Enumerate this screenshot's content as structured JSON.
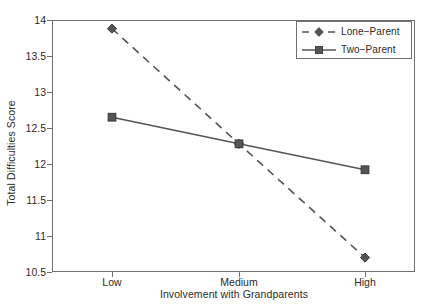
{
  "chart_data": {
    "type": "line",
    "title": "",
    "xlabel": "Involvement with Grandparents",
    "ylabel": "Total Difficulties Score",
    "categories": [
      "Low",
      "Medium",
      "High"
    ],
    "xtick_labels": [
      "Low",
      "Medium",
      "High"
    ],
    "ytick_labels": [
      "14",
      "13.5",
      "13",
      "12.5",
      "12",
      "11.5",
      "11",
      "10.5"
    ],
    "ytick_values": [
      14,
      13.5,
      13,
      12.5,
      12,
      11.5,
      11,
      10.5
    ],
    "ylim": [
      10.5,
      14
    ],
    "xlim": [
      0,
      2
    ],
    "grid": false,
    "legend_position": "top-right",
    "series": [
      {
        "name": "Lone−Parent",
        "values": [
          13.88,
          12.28,
          10.7
        ],
        "line_style": "dashed",
        "marker": "diamond",
        "color": "#555555"
      },
      {
        "name": "Two−Parent",
        "values": [
          12.65,
          12.28,
          11.92
        ],
        "line_style": "solid",
        "marker": "square",
        "color": "#555555"
      }
    ]
  },
  "legend": {
    "entries": [
      {
        "label": "Lone−Parent",
        "marker": "diamond",
        "line_style": "dashed"
      },
      {
        "label": "Two−Parent",
        "marker": "square",
        "line_style": "solid"
      }
    ]
  },
  "colors": {
    "series_ink": "#555555",
    "axis": "#6f6f6f",
    "text": "#2b2b2b",
    "plot_background": "#ffffff",
    "figure_background": "#ffffff"
  }
}
